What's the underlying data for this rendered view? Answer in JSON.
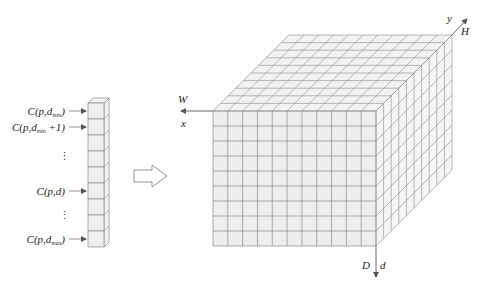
{
  "figure": {
    "colors": {
      "cell_fill": "#eeeeee",
      "grid_line": "#8a8a8a",
      "text": "#222222",
      "background": "#ffffff"
    }
  },
  "column": {
    "cells": 9,
    "labels": [
      {
        "prefix": "C(p,d",
        "sub": "min",
        "suffix": ")",
        "row": 0
      },
      {
        "prefix": "C(p,d",
        "sub": "min",
        "suffix": " +1)",
        "row": 1
      },
      {
        "prefix": "⋮",
        "sub": "",
        "suffix": "",
        "row": 2.8
      },
      {
        "prefix": "C(p,d)",
        "sub": "",
        "suffix": "",
        "row": 5
      },
      {
        "prefix": "⋮",
        "sub": "",
        "suffix": "",
        "row": 6.5
      },
      {
        "prefix": "C(p,d",
        "sub": "max",
        "suffix": ")",
        "row": 8
      }
    ]
  },
  "transition_arrow": {
    "shape": "hollow-right-arrow"
  },
  "volume": {
    "columns": 11,
    "rows": 9,
    "depth": 10,
    "axes": {
      "width_label": "W",
      "width_var": "x",
      "height_label": "H",
      "height_var": "y",
      "depth_label": "D",
      "depth_var": "d"
    }
  }
}
